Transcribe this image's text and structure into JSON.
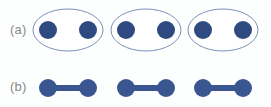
{
  "figure": {
    "background_color": "#fdfefe",
    "width": 271,
    "height": 107
  },
  "panels": [
    {
      "id": "a",
      "label": "(a)",
      "label_color": "#8a8a8a",
      "description": "molecular-pairs-in-ellipses",
      "ellipse_outline_color": "#7a92b8",
      "ellipse_fill_color": "#ffffff",
      "atom_color": "#2e4a80",
      "groups": [
        {
          "cx": 68,
          "cy": 30,
          "rx": 35,
          "ry": 21,
          "atoms": [
            {
              "cx": 48,
              "cy": 30,
              "r": 9
            },
            {
              "cx": 88,
              "cy": 30,
              "r": 9
            }
          ]
        },
        {
          "cx": 146,
          "cy": 30,
          "rx": 35,
          "ry": 21,
          "atoms": [
            {
              "cx": 126,
              "cy": 30,
              "r": 9
            },
            {
              "cx": 166,
              "cy": 30,
              "r": 9
            }
          ]
        },
        {
          "cx": 223,
          "cy": 30,
          "rx": 35,
          "ry": 21,
          "atoms": [
            {
              "cx": 203,
              "cy": 30,
              "r": 9
            },
            {
              "cx": 243,
              "cy": 30,
              "r": 9
            }
          ]
        }
      ]
    },
    {
      "id": "b",
      "label": "(b)",
      "label_color": "#8a8a8a",
      "description": "bonded-dimers",
      "atom_color": "#3a5691",
      "bond_color": "#3a5691",
      "bond_thickness": 6,
      "groups": [
        {
          "atoms": [
            {
              "cx": 48,
              "cy": 88,
              "r": 9
            },
            {
              "cx": 88,
              "cy": 88,
              "r": 9
            }
          ],
          "bond": {
            "x1": 48,
            "y1": 88,
            "x2": 88,
            "y2": 88
          }
        },
        {
          "atoms": [
            {
              "cx": 126,
              "cy": 88,
              "r": 9
            },
            {
              "cx": 166,
              "cy": 88,
              "r": 9
            }
          ],
          "bond": {
            "x1": 126,
            "y1": 88,
            "x2": 166,
            "y2": 88
          }
        },
        {
          "atoms": [
            {
              "cx": 203,
              "cy": 88,
              "r": 9
            },
            {
              "cx": 243,
              "cy": 88,
              "r": 9
            }
          ],
          "bond": {
            "x1": 203,
            "y1": 88,
            "x2": 243,
            "y2": 88
          }
        }
      ]
    }
  ]
}
